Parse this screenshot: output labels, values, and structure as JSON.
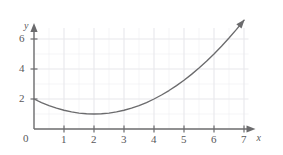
{
  "chart_data": {
    "type": "line",
    "title": "",
    "subtitle": "",
    "xlabel": "x",
    "ylabel": "y",
    "xlim": [
      0,
      7.35
    ],
    "ylim": [
      0,
      7.0
    ],
    "grid": true,
    "legend": null,
    "legend_position": "none",
    "x_ticks": [
      0,
      1,
      2,
      3,
      4,
      5,
      6,
      7
    ],
    "x_tick_labels": [
      "0",
      "1",
      "2",
      "3",
      "4",
      "5",
      "6",
      "7"
    ],
    "y_ticks": [
      2,
      4,
      6
    ],
    "y_tick_labels": [
      "2",
      "4",
      "6"
    ],
    "origin_label": "0",
    "curve_color": "#6b6b6d",
    "axis_color": "#6b6b6d",
    "grid_color": "#e8e8ec",
    "background_color": "#ffffff",
    "annotations": [
      {
        "name": "curve-arrowhead",
        "text": "",
        "at_x": 7.0,
        "at_y": 7.25
      },
      {
        "name": "x-axis-arrowhead",
        "text": "",
        "at_x": 7.35,
        "at_y": 0
      },
      {
        "name": "y-axis-arrowhead",
        "text": "",
        "at_x": 0,
        "at_y": 7.0
      }
    ],
    "series": [
      {
        "name": "parabola",
        "equation": "y = 0.25(x - 2)^2 + 1",
        "vertex": [
          2,
          1
        ],
        "y_intercept": [
          0,
          2
        ],
        "x": [
          0,
          0.25,
          0.5,
          0.75,
          1,
          1.25,
          1.5,
          1.75,
          2,
          2.25,
          2.5,
          2.75,
          3,
          3.25,
          3.5,
          3.75,
          4,
          4.25,
          4.5,
          4.75,
          5,
          5.25,
          5.5,
          5.75,
          6,
          6.25,
          6.5,
          6.75,
          7
        ],
        "values": [
          2,
          1.7656,
          1.5625,
          1.3906,
          1.25,
          1.1406,
          1.0625,
          1.0156,
          1,
          1.0156,
          1.0625,
          1.1406,
          1.25,
          1.3906,
          1.5625,
          1.7656,
          2,
          2.2656,
          2.5625,
          2.8906,
          3.25,
          3.6406,
          4.0625,
          4.5156,
          5,
          5.5156,
          6.0625,
          6.6406,
          7.25
        ]
      }
    ]
  },
  "geometry": {
    "origin_px": [
      34,
      129
    ],
    "px_per_unit_x": 30,
    "px_per_unit_y": 15
  }
}
